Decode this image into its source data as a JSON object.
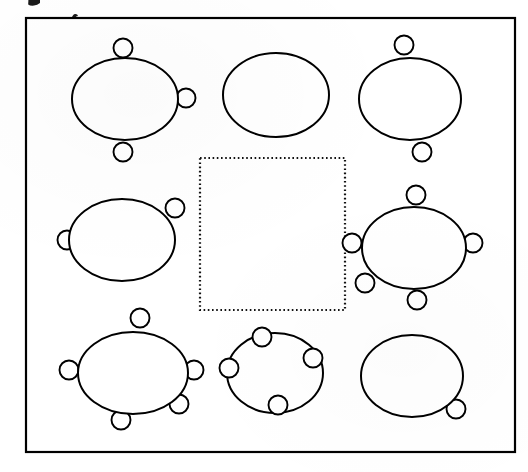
{
  "document": {
    "kind": "scanned-line-drawing",
    "title": "Banquet room table and chair layout",
    "canvas": {
      "width": 528,
      "height": 472
    },
    "background_color": "#ffffff",
    "ink_color": "#000000"
  },
  "room": {
    "label": "room-outline",
    "x": 26,
    "y": 18,
    "width": 489,
    "height": 434,
    "stroke_color": "#000000",
    "stroke_width": 2.2
  },
  "center_zone": {
    "label": "dotted-center-zone",
    "x": 200,
    "y": 158,
    "width": 145,
    "height": 152,
    "stroke_style": "dotted",
    "stroke_color": "#111111"
  },
  "seat_radius": 9.5,
  "tables": [
    {
      "id": "table-top-left",
      "position_label": "top-left",
      "cx": 125,
      "cy": 99,
      "rx": 53,
      "ry": 41,
      "seat_count": 3,
      "seats": [
        {
          "id": "seat-tl-top",
          "angle_deg": 268,
          "cx": 123,
          "cy": 48
        },
        {
          "id": "seat-tl-right",
          "angle_deg": 8,
          "cx": 186,
          "cy": 98
        },
        {
          "id": "seat-tl-bottom",
          "angle_deg": 86,
          "cx": 123,
          "cy": 152
        }
      ]
    },
    {
      "id": "table-top-center",
      "position_label": "top-center",
      "cx": 276,
      "cy": 95,
      "rx": 53,
      "ry": 42,
      "seat_count": 1,
      "seats": [
        {
          "id": "seat-tc-right",
          "angle_deg": 6,
          "cx": 317,
          "cy": 97
        }
      ]
    },
    {
      "id": "table-top-right",
      "position_label": "top-right",
      "cx": 410,
      "cy": 99,
      "rx": 51,
      "ry": 41,
      "seat_count": 2,
      "seats": [
        {
          "id": "seat-tr-top",
          "angle_deg": 272,
          "cx": 404,
          "cy": 45
        },
        {
          "id": "seat-tr-bottom",
          "angle_deg": 88,
          "cx": 422,
          "cy": 152
        }
      ]
    },
    {
      "id": "table-middle-left",
      "position_label": "middle-left",
      "cx": 122,
      "cy": 240,
      "rx": 53,
      "ry": 41,
      "seat_count": 2,
      "seats": [
        {
          "id": "seat-ml-left",
          "angle_deg": 180,
          "cx": 67,
          "cy": 240
        },
        {
          "id": "seat-ml-upper-right",
          "angle_deg": 318,
          "cx": 175,
          "cy": 208
        }
      ]
    },
    {
      "id": "table-middle-right",
      "position_label": "middle-right",
      "cx": 414,
      "cy": 248,
      "rx": 52,
      "ry": 41,
      "seat_count": 5,
      "seats": [
        {
          "id": "seat-mr-top",
          "angle_deg": 268,
          "cx": 416,
          "cy": 195
        },
        {
          "id": "seat-mr-left",
          "angle_deg": 182,
          "cx": 352,
          "cy": 243
        },
        {
          "id": "seat-mr-right",
          "angle_deg": 2,
          "cx": 473,
          "cy": 243
        },
        {
          "id": "seat-mr-bottom-left",
          "angle_deg": 126,
          "cx": 365,
          "cy": 283
        },
        {
          "id": "seat-mr-bottom",
          "angle_deg": 84,
          "cx": 417,
          "cy": 300
        }
      ]
    },
    {
      "id": "table-bottom-left",
      "position_label": "bottom-left",
      "cx": 133,
      "cy": 373,
      "rx": 55,
      "ry": 41,
      "seat_count": 5,
      "seats": [
        {
          "id": "seat-bl-top",
          "angle_deg": 270,
          "cx": 140,
          "cy": 318
        },
        {
          "id": "seat-bl-left",
          "angle_deg": 180,
          "cx": 69,
          "cy": 370
        },
        {
          "id": "seat-bl-right",
          "angle_deg": 0,
          "cx": 194,
          "cy": 370
        },
        {
          "id": "seat-bl-bottom-right",
          "angle_deg": 50,
          "cx": 179,
          "cy": 404
        },
        {
          "id": "seat-bl-bottom",
          "angle_deg": 92,
          "cx": 121,
          "cy": 420
        }
      ]
    },
    {
      "id": "table-bottom-center",
      "position_label": "bottom-center",
      "cx": 275,
      "cy": 373,
      "rx": 48,
      "ry": 40,
      "seat_count": 4,
      "seats": [
        {
          "id": "seat-bc-top-left",
          "angle_deg": 250,
          "cx": 262,
          "cy": 337
        },
        {
          "id": "seat-bc-left",
          "angle_deg": 170,
          "cx": 229,
          "cy": 368
        },
        {
          "id": "seat-bc-right",
          "angle_deg": 340,
          "cx": 313,
          "cy": 358
        },
        {
          "id": "seat-bc-bottom",
          "angle_deg": 80,
          "cx": 278,
          "cy": 405
        }
      ]
    },
    {
      "id": "table-bottom-right",
      "position_label": "bottom-right",
      "cx": 412,
      "cy": 376,
      "rx": 51,
      "ry": 41,
      "seat_count": 1,
      "seats": [
        {
          "id": "seat-br-bottom-right",
          "angle_deg": 38,
          "cx": 456,
          "cy": 409
        }
      ]
    }
  ],
  "scan_artifacts": [
    {
      "id": "artifact-top-left-glyph",
      "x": 27,
      "y": 0,
      "width": 13,
      "height": 7
    },
    {
      "id": "artifact-top-border-tick",
      "x": 71,
      "y": 14,
      "width": 7,
      "height": 5
    }
  ]
}
